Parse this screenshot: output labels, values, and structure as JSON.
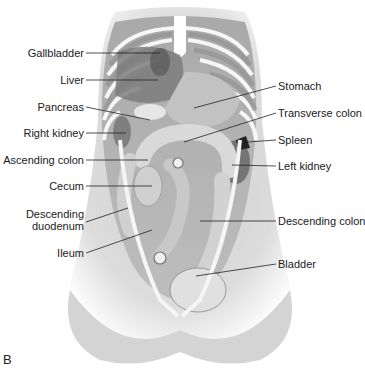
{
  "figure": {
    "panel_letter": "B",
    "left_labels": [
      {
        "text": "Gallbladder",
        "x": 84,
        "y": 53
      },
      {
        "text": "Liver",
        "x": 84,
        "y": 80
      },
      {
        "text": "Pancreas",
        "x": 84,
        "y": 107
      },
      {
        "text": "Right kidney",
        "x": 84,
        "y": 133
      },
      {
        "text": "Ascending colon",
        "x": 84,
        "y": 160
      },
      {
        "text": "Cecum",
        "x": 84,
        "y": 186
      },
      {
        "text": "Descending",
        "x": 84,
        "y": 214
      },
      {
        "text": "duodenum",
        "x": 84,
        "y": 226
      },
      {
        "text": "Ileum",
        "x": 84,
        "y": 253
      }
    ],
    "right_labels": [
      {
        "text": "Stomach",
        "x": 278,
        "y": 86
      },
      {
        "text": "Transverse colon",
        "x": 278,
        "y": 113
      },
      {
        "text": "Spleen",
        "x": 278,
        "y": 140
      },
      {
        "text": "Left kidney",
        "x": 278,
        "y": 166
      },
      {
        "text": "Descending colon",
        "x": 278,
        "y": 221
      },
      {
        "text": "Bladder",
        "x": 278,
        "y": 264
      }
    ]
  }
}
